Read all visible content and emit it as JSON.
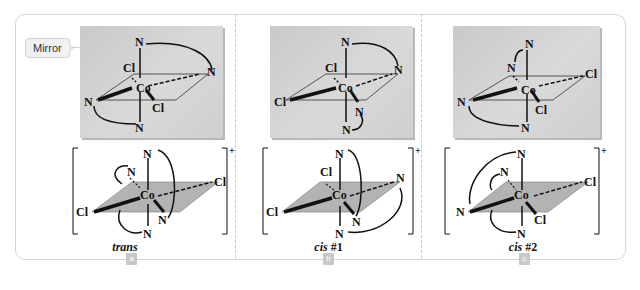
{
  "callout": {
    "mirror_label": "Mirror"
  },
  "panels": [
    {
      "id": "a",
      "badge": "a",
      "caption_italic": "trans",
      "caption_num": "",
      "mirror_atoms": {
        "top": "N",
        "upper_left": "Cl",
        "right": "N",
        "center": "Co",
        "left": "N",
        "lower": "Cl",
        "bottom": "N"
      },
      "complex_atoms": {
        "top": "N",
        "back_left": "N",
        "right": "Cl",
        "center": "Co",
        "left": "Cl",
        "front": "N",
        "bottom": "N"
      },
      "charge": "+"
    },
    {
      "id": "b",
      "badge": "b",
      "caption_italic": "cis",
      "caption_num": " #1",
      "mirror_atoms": {
        "top": "N",
        "upper_left": "Cl",
        "right": "N",
        "center": "Co",
        "left": "Cl",
        "lower": "N",
        "bottom": "N"
      },
      "complex_atoms": {
        "top": "N",
        "back_left": "Cl",
        "right": "N",
        "center": "Co",
        "left": "Cl",
        "front": "N",
        "bottom": "N"
      },
      "charge": "+"
    },
    {
      "id": "c",
      "badge": "c",
      "caption_italic": "cis",
      "caption_num": " #2",
      "mirror_atoms": {
        "top": "N",
        "upper_left": "N",
        "right": "Cl",
        "center": "Co",
        "left": "N",
        "lower": "Cl",
        "bottom": "N"
      },
      "complex_atoms": {
        "top": "N",
        "back_left": "N",
        "right": "Cl",
        "center": "Co",
        "left": "N",
        "front": "Cl",
        "bottom": "N"
      },
      "charge": "+"
    }
  ],
  "colors": {
    "mirror_bg": "#d0d0d0",
    "plane_fill": "#b3b3b3",
    "badge_bg": "#c8c8c8",
    "frame_border": "#d6d6d6"
  }
}
